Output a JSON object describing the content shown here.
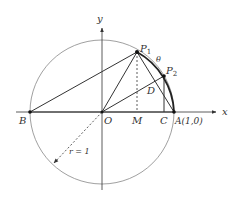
{
  "diagram": {
    "type": "unit-circle-geometry",
    "axis_labels": {
      "x": "x",
      "y": "y"
    },
    "points": {
      "P1": {
        "label": "P",
        "sub": "1"
      },
      "P2": {
        "label": "P",
        "sub": "2"
      },
      "O": {
        "label": "O"
      },
      "M": {
        "label": "M"
      },
      "C": {
        "label": "C"
      },
      "A": {
        "label": "A(1,0)"
      },
      "B": {
        "label": "B"
      },
      "D": {
        "label": "D"
      }
    },
    "angle_label": "θ",
    "radius_label": "r = 1",
    "colors": {
      "stroke": "#333333",
      "circle": "#777777"
    }
  }
}
